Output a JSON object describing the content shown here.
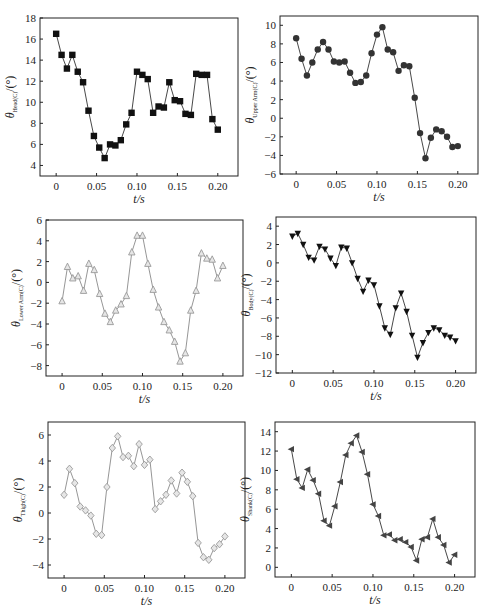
{
  "chart_data": [
    {
      "id": "head",
      "type": "line",
      "marker": "square",
      "marker_color": "#111111",
      "ylabel": "θ_Head(C)/(°)",
      "ylabel_symbol": "θ",
      "ylabel_subscript": "Head(C)",
      "ylabel_unit": "/(°)",
      "xlabel": "t/s",
      "xticks": [
        "0",
        "0.05",
        "0.10",
        "0.15",
        "0.20"
      ],
      "yticks": [
        4,
        6,
        8,
        10,
        12,
        14,
        16,
        18
      ],
      "ylim": [
        3,
        18
      ],
      "xlim": [
        -0.02,
        0.225
      ],
      "frame": {
        "x0": 40,
        "x1": 238,
        "y0": 18,
        "y1": 176
      },
      "x": [
        0,
        0.0067,
        0.0133,
        0.02,
        0.0267,
        0.0333,
        0.04,
        0.0467,
        0.0533,
        0.06,
        0.0667,
        0.0733,
        0.08,
        0.0867,
        0.0933,
        0.1,
        0.1067,
        0.1133,
        0.12,
        0.1267,
        0.1333,
        0.14,
        0.1467,
        0.1533,
        0.16,
        0.1667,
        0.1733,
        0.18,
        0.1867,
        0.1933,
        0.2
      ],
      "values": [
        16.5,
        14.5,
        13.2,
        14.5,
        12.9,
        11.9,
        9.2,
        6.8,
        5.7,
        4.7,
        6.0,
        5.9,
        6.4,
        7.9,
        9.0,
        12.9,
        12.6,
        12.2,
        9.0,
        9.6,
        9.5,
        11.9,
        10.2,
        10.1,
        8.9,
        8.8,
        12.7,
        12.6,
        12.6,
        8.4,
        7.4
      ]
    },
    {
      "id": "upper-arm",
      "type": "line",
      "marker": "circle",
      "marker_color": "#333333",
      "ylabel": "θ_Upper Arm(C)/(°)",
      "ylabel_symbol": "θ",
      "ylabel_subscript": "Upper Arm(C)",
      "ylabel_unit": "/(°)",
      "xlabel": "t/s",
      "xticks": [
        "0",
        "0.05",
        "0.10",
        "0.15",
        "0.20"
      ],
      "yticks": [
        -6,
        -4,
        -2,
        0,
        2,
        4,
        6,
        8,
        10
      ],
      "ylim": [
        -6,
        11
      ],
      "xlim": [
        -0.02,
        0.225
      ],
      "frame": {
        "x0": 280,
        "x1": 478,
        "y0": 16,
        "y1": 174
      },
      "x": [
        0,
        0.0067,
        0.0133,
        0.02,
        0.0267,
        0.0333,
        0.04,
        0.0467,
        0.0533,
        0.06,
        0.0667,
        0.0733,
        0.08,
        0.0867,
        0.0933,
        0.1,
        0.1067,
        0.1133,
        0.12,
        0.1267,
        0.1333,
        0.14,
        0.1467,
        0.1533,
        0.16,
        0.1667,
        0.1733,
        0.18,
        0.1867,
        0.1933,
        0.2
      ],
      "values": [
        8.6,
        6.4,
        4.6,
        6.0,
        7.4,
        8.2,
        7.4,
        6.1,
        6.0,
        6.1,
        4.9,
        3.8,
        3.9,
        4.6,
        7.0,
        9.0,
        9.8,
        7.4,
        7.1,
        5.1,
        5.7,
        5.6,
        2.2,
        -1.6,
        -4.3,
        -2.1,
        -1.2,
        -1.4,
        -2.0,
        -3.1,
        -3.0
      ]
    },
    {
      "id": "lower-arm",
      "type": "line",
      "marker": "triangle-up",
      "marker_color": "#9a9a9a",
      "ylabel": "θ_Lower Arm(C)/(°)",
      "ylabel_symbol": "θ",
      "ylabel_subscript": "Lower Arm(C)",
      "ylabel_unit": "/(°)",
      "xlabel": "t/s",
      "xticks": [
        "0",
        "0.05",
        "0.10",
        "0.15",
        "0.20"
      ],
      "yticks": [
        -8,
        -6,
        -4,
        -2,
        0,
        2,
        4,
        6
      ],
      "ylim": [
        -9,
        6
      ],
      "xlim": [
        -0.02,
        0.225
      ],
      "frame": {
        "x0": 46,
        "x1": 243,
        "y0": 220,
        "y1": 376
      },
      "x": [
        0,
        0.0067,
        0.0133,
        0.02,
        0.0267,
        0.0333,
        0.04,
        0.0467,
        0.0533,
        0.06,
        0.0667,
        0.0733,
        0.08,
        0.0867,
        0.0933,
        0.1,
        0.1067,
        0.1133,
        0.12,
        0.1267,
        0.1333,
        0.14,
        0.1467,
        0.1533,
        0.16,
        0.1667,
        0.1733,
        0.18,
        0.1867,
        0.1933,
        0.2
      ],
      "values": [
        -1.8,
        1.5,
        0.4,
        0.6,
        -0.8,
        1.8,
        1.2,
        -1.1,
        -3.0,
        -3.8,
        -2.7,
        -2.1,
        -1.3,
        2.9,
        4.5,
        4.5,
        1.8,
        -0.7,
        -2.4,
        -3.8,
        -4.6,
        -5.7,
        -7.6,
        -6.8,
        -2.7,
        -0.8,
        2.8,
        2.3,
        2.2,
        0.4,
        1.6
      ]
    },
    {
      "id": "body",
      "type": "line",
      "marker": "triangle-down",
      "marker_color": "#111111",
      "ylabel": "θ_Body(C)/(°)",
      "ylabel_symbol": "θ",
      "ylabel_subscript": "Body(C)",
      "ylabel_unit": "/(°)",
      "xlabel": "t/s",
      "xticks": [
        "0",
        "0.05",
        "0.10",
        "0.15",
        "0.20"
      ],
      "yticks": [
        -12,
        -10,
        -8,
        -6,
        -4,
        -2,
        0,
        2,
        4
      ],
      "ylim": [
        -12,
        5
      ],
      "xlim": [
        -0.02,
        0.225
      ],
      "frame": {
        "x0": 276,
        "x1": 476,
        "y0": 217,
        "y1": 373
      },
      "x": [
        0,
        0.0067,
        0.0133,
        0.02,
        0.0267,
        0.0333,
        0.04,
        0.0467,
        0.0533,
        0.06,
        0.0667,
        0.0733,
        0.08,
        0.0867,
        0.0933,
        0.1,
        0.1067,
        0.1133,
        0.12,
        0.1267,
        0.1333,
        0.14,
        0.1467,
        0.1533,
        0.16,
        0.1667,
        0.1733,
        0.18,
        0.1867,
        0.1933,
        0.2
      ],
      "values": [
        2.9,
        3.2,
        2.0,
        0.6,
        0.3,
        1.8,
        1.5,
        0.5,
        -0.3,
        1.7,
        1.6,
        0.0,
        -1.7,
        -3.1,
        -1.9,
        -2.4,
        -4.7,
        -7.1,
        -7.8,
        -4.9,
        -3.3,
        -5.3,
        -7.9,
        -10.3,
        -8.7,
        -7.6,
        -7.1,
        -7.3,
        -7.9,
        -8.1,
        -8.5
      ]
    },
    {
      "id": "thigh",
      "type": "line",
      "marker": "diamond",
      "marker_color": "#9a9a9a",
      "ylabel": "θ_Thigh(C)/(°)",
      "ylabel_symbol": "θ",
      "ylabel_subscript": "Thigh(C)",
      "ylabel_unit": "/(°)",
      "xlabel": "t/s",
      "xticks": [
        "0",
        "0.05",
        "0.10",
        "0.15",
        "0.20"
      ],
      "yticks": [
        -4,
        -2,
        0,
        2,
        4,
        6
      ],
      "ylim": [
        -5,
        7
      ],
      "xlim": [
        -0.02,
        0.225
      ],
      "frame": {
        "x0": 48,
        "x1": 245,
        "y0": 422,
        "y1": 578
      },
      "x": [
        0,
        0.0067,
        0.0133,
        0.02,
        0.0267,
        0.0333,
        0.04,
        0.0467,
        0.0533,
        0.06,
        0.0667,
        0.0733,
        0.08,
        0.0867,
        0.0933,
        0.1,
        0.1067,
        0.1133,
        0.12,
        0.1267,
        0.1333,
        0.14,
        0.1467,
        0.1533,
        0.16,
        0.1667,
        0.1733,
        0.18,
        0.1867,
        0.1933,
        0.2
      ],
      "values": [
        1.4,
        3.4,
        2.3,
        0.5,
        0.2,
        -0.2,
        -1.6,
        -1.7,
        2.0,
        5.0,
        5.9,
        4.3,
        4.4,
        3.6,
        5.3,
        3.7,
        4.1,
        0.3,
        0.9,
        1.4,
        2.5,
        1.5,
        3.1,
        2.4,
        1.3,
        -2.3,
        -3.4,
        -3.6,
        -2.7,
        -2.4,
        -1.8
      ]
    },
    {
      "id": "shank",
      "type": "line",
      "marker": "triangle-left",
      "marker_color": "#444444",
      "ylabel": "θ_Shank(C)/(°)",
      "ylabel_symbol": "θ",
      "ylabel_subscript": "Shank(C)",
      "ylabel_unit": "/(°)",
      "xlabel": "t/s",
      "xticks": [
        "0",
        "0.05",
        "0.10",
        "0.15",
        "0.20"
      ],
      "yticks": [
        0,
        2,
        4,
        6,
        8,
        10,
        12,
        14
      ],
      "ylim": [
        -1,
        15
      ],
      "xlim": [
        -0.02,
        0.225
      ],
      "frame": {
        "x0": 275,
        "x1": 475,
        "y0": 422,
        "y1": 577
      },
      "x": [
        0,
        0.0067,
        0.0133,
        0.02,
        0.0267,
        0.0333,
        0.04,
        0.0467,
        0.0533,
        0.06,
        0.0667,
        0.0733,
        0.08,
        0.0867,
        0.0933,
        0.1,
        0.1067,
        0.1133,
        0.12,
        0.1267,
        0.1333,
        0.14,
        0.1467,
        0.1533,
        0.16,
        0.1667,
        0.1733,
        0.18,
        0.1867,
        0.1933,
        0.2
      ],
      "values": [
        12.2,
        9.1,
        8.2,
        10.1,
        9.0,
        7.6,
        4.8,
        4.3,
        6.3,
        8.8,
        11.6,
        12.8,
        13.6,
        11.9,
        9.6,
        6.5,
        5.3,
        3.3,
        3.4,
        2.8,
        2.9,
        2.6,
        2.1,
        0.7,
        2.9,
        3.1,
        5.0,
        3.1,
        2.3,
        0.5,
        1.3
      ]
    }
  ]
}
